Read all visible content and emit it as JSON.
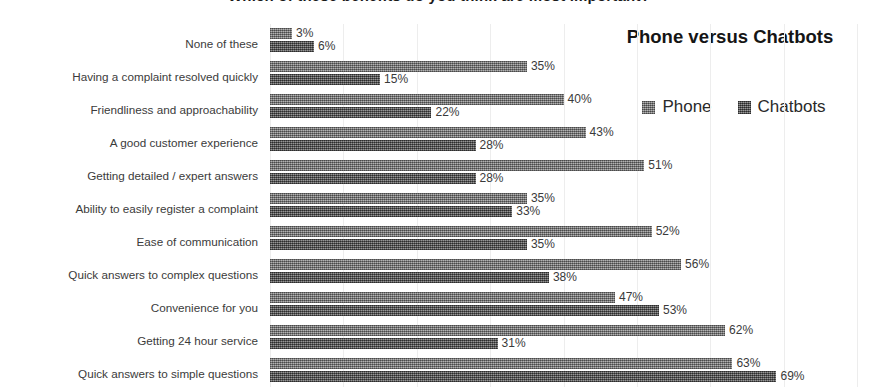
{
  "figure": {
    "cut_off_title": "Which of these benefits do you think are most important?"
  },
  "chart_data": {
    "type": "bar",
    "orientation": "horizontal",
    "title": "Phone versus Chatbots",
    "xlabel": "",
    "ylabel": "",
    "xlim": [
      0,
      80
    ],
    "grid": true,
    "legend_position": "top-right",
    "value_suffix": "%",
    "categories": [
      "None of these",
      "Having a complaint resolved quickly",
      "Friendliness and approachability",
      "A good customer experience",
      "Getting detailed / expert answers",
      "Ability to easily register a complaint",
      "Ease of communication",
      "Quick answers to complex questions",
      "Convenience for you",
      "Getting 24 hour service",
      "Quick answers to simple questions"
    ],
    "series": [
      {
        "name": "Phone",
        "color": "#8f8f8f",
        "values": [
          3,
          35,
          40,
          43,
          51,
          35,
          52,
          56,
          47,
          62,
          63
        ],
        "labels": [
          "3%",
          "35%",
          "40%",
          "43%",
          "51%",
          "35%",
          "52%",
          "56%",
          "47%",
          "62%",
          "63%"
        ]
      },
      {
        "name": "Chatbots",
        "color": "#6d6d6d",
        "values": [
          6,
          15,
          22,
          28,
          28,
          33,
          35,
          38,
          53,
          31,
          69
        ],
        "labels": [
          "6%",
          "15%",
          "22%",
          "28%",
          "28%",
          "33%",
          "35%",
          "38%",
          "53%",
          "31%",
          "69%"
        ]
      }
    ]
  },
  "legend": {
    "entries": [
      {
        "label": "Phone"
      },
      {
        "label": "Chatbots"
      }
    ]
  }
}
